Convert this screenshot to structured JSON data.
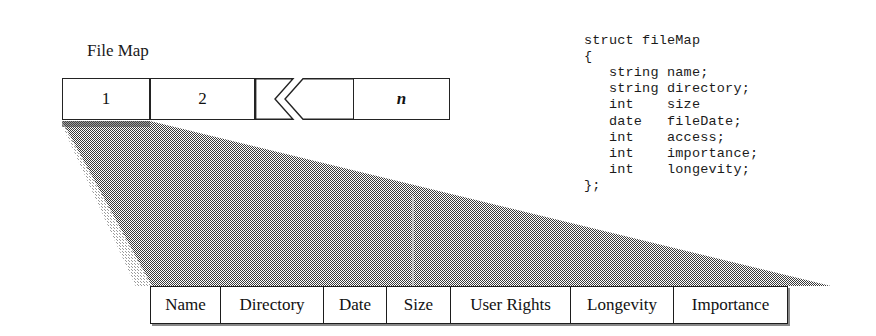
{
  "diagram": {
    "title": "File Map",
    "array": {
      "caption": "File Map",
      "cells": [
        {
          "label": "1"
        },
        {
          "label": "2"
        },
        {
          "label": "n"
        }
      ],
      "break_symbol": "chevron-break"
    },
    "funnel": {
      "fill": "#6b6b6b",
      "edge_highlight": "#c9c9c9",
      "description": "expansion-funnel"
    },
    "record_table": {
      "columns": [
        {
          "label": "Name",
          "width": 70
        },
        {
          "label": "Directory",
          "width": 103
        },
        {
          "label": "Date",
          "width": 63
        },
        {
          "label": "Size",
          "width": 64
        },
        {
          "label": "User Rights",
          "width": 120
        },
        {
          "label": "Longevity",
          "width": 103
        },
        {
          "label": "Importance",
          "width": 113
        }
      ]
    },
    "struct": {
      "lines": [
        "struct fileMap",
        "{",
        "   string name;",
        "   string directory;",
        "   int    size",
        "   date   fileDate;",
        "   int    access;",
        "   int    importance;",
        "   int    longevity;",
        "};"
      ],
      "text": "struct fileMap\n{\n   string name;\n   string directory;\n   int    size\n   date   fileDate;\n   int    access;\n   int    importance;\n   int    longevity;\n};"
    }
  }
}
